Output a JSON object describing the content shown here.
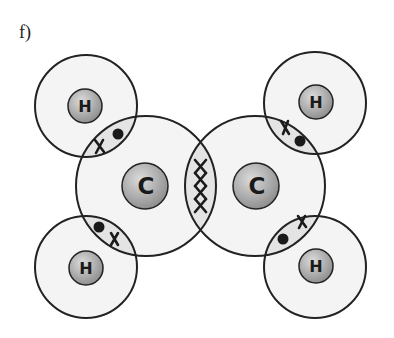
{
  "figure": {
    "label": "f)",
    "colors": {
      "outline": "#222222",
      "shell_fill": "#f3f3f3",
      "overlap_fill": "#e6e6e6",
      "nucleus_light": "#d6d6d6",
      "nucleus_dark": "#8e8e8e"
    }
  },
  "atoms": [
    {
      "id": "H1",
      "symbol": "H",
      "position": "top-left"
    },
    {
      "id": "C1",
      "symbol": "C",
      "position": "center-left"
    },
    {
      "id": "C2",
      "symbol": "C",
      "position": "center-right"
    },
    {
      "id": "H2",
      "symbol": "H",
      "position": "top-right"
    },
    {
      "id": "H3",
      "symbol": "H",
      "position": "bottom-left"
    },
    {
      "id": "H4",
      "symbol": "H",
      "position": "bottom-right"
    }
  ],
  "bonds": [
    {
      "between": "H1-C1",
      "electrons": [
        "x",
        "•"
      ]
    },
    {
      "between": "H3-C1",
      "electrons": [
        "•",
        "x"
      ]
    },
    {
      "between": "C1-C2",
      "electrons": [
        "x",
        "x",
        "x",
        "x"
      ]
    },
    {
      "between": "H2-C2",
      "electrons": [
        "x",
        "•"
      ]
    },
    {
      "between": "H4-C2",
      "electrons": [
        "•",
        "x"
      ]
    }
  ]
}
